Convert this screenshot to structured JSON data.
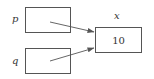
{
  "diagram": {
    "nodes": [
      {
        "id": "p",
        "label": "p",
        "kind": "pointer",
        "value": ""
      },
      {
        "id": "q",
        "label": "q",
        "kind": "pointer",
        "value": ""
      },
      {
        "id": "x",
        "label": "x",
        "kind": "variable",
        "value": "10"
      }
    ],
    "edges": [
      {
        "from": "p",
        "to": "x"
      },
      {
        "from": "q",
        "to": "x"
      }
    ],
    "colors": {
      "stroke": "#555555",
      "text": "#333333",
      "background": "#ffffff"
    }
  }
}
